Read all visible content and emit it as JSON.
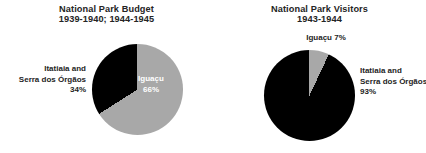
{
  "page": {
    "background_color": "#ffffff",
    "text_color": "#242424"
  },
  "palette": {
    "slice_dark": "#000000",
    "slice_grey": "#a8a8a8",
    "label_on_dark": "#ffffff"
  },
  "charts": {
    "budget": {
      "title": "National Park Budget",
      "subtitle": "1939-1940; 1944-1945",
      "labels": {
        "iguacu_name": "Iguaçu",
        "iguacu_value": "66%",
        "itatiaia_line1": "Itatiaia and",
        "itatiaia_line2": "Serra dos Órgãos",
        "itatiaia_value": "34%"
      }
    },
    "visitors": {
      "title": "National Park Visitors",
      "subtitle": "1943-1944",
      "labels": {
        "iguacu_combined": "Iguaçu 7%",
        "itatiaia_line1": "Itatiaia and",
        "itatiaia_line2": "Serra dos Órgãos",
        "itatiaia_value": "93%"
      }
    }
  },
  "chart_data": [
    {
      "type": "pie",
      "title": "National Park Budget",
      "subtitle": "1939-1940; 1944-1945",
      "categories": [
        "Iguaçu",
        "Itatiaia and Serra dos Órgãos"
      ],
      "values": [
        66,
        34
      ],
      "unit": "%",
      "colors": [
        "#a8a8a8",
        "#000000"
      ],
      "start_angle_deg": 0,
      "direction": "clockwise",
      "legend": "none",
      "data_labels": [
        "Iguaçu 66%",
        "Itatiaia and Serra dos Órgãos 34%"
      ],
      "label_placement": [
        "inside",
        "outside-left"
      ]
    },
    {
      "type": "pie",
      "title": "National Park Visitors",
      "subtitle": "1943-1944",
      "categories": [
        "Iguaçu",
        "Itatiaia and Serra dos Órgãos"
      ],
      "values": [
        7,
        93
      ],
      "unit": "%",
      "colors": [
        "#a8a8a8",
        "#000000"
      ],
      "start_angle_deg": 0,
      "direction": "clockwise",
      "legend": "none",
      "data_labels": [
        "Iguaçu 7%",
        "Itatiaia and Serra dos Órgãos 93%"
      ],
      "label_placement": [
        "outside-top",
        "outside-right"
      ]
    }
  ]
}
